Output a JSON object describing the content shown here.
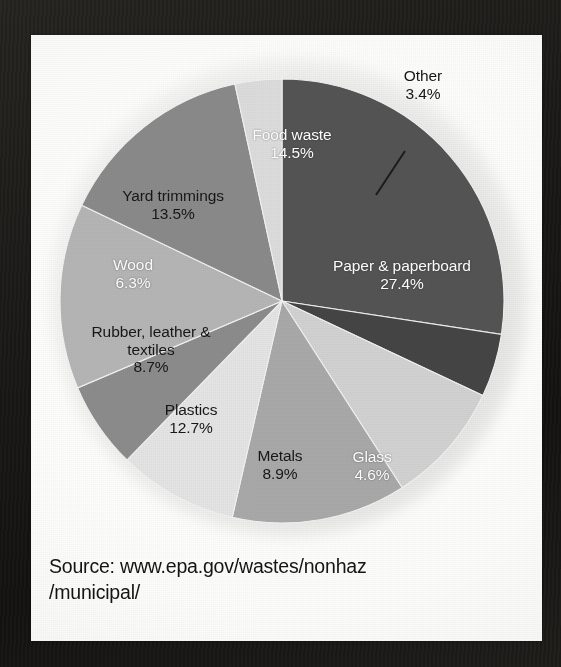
{
  "page": {
    "source_note_line1": "Source: www.epa.gov/wastes/nonhaz",
    "source_note_line2": "/municipal/"
  },
  "chart_data": {
    "type": "pie",
    "title": "",
    "subtitle": "",
    "xlabel": "",
    "ylabel": "",
    "legend_position": "none",
    "labels_inside_slices": true,
    "value_unit": "percent",
    "total": 100.0,
    "start_angle_deg": 0,
    "direction": "clockwise",
    "categories": [
      "Paper & paperboard",
      "Glass",
      "Metals",
      "Plastics",
      "Rubber, leather & textiles",
      "Wood",
      "Yard trimmings",
      "Food waste",
      "Other"
    ],
    "values": [
      27.4,
      4.6,
      8.9,
      12.7,
      8.7,
      6.3,
      13.5,
      14.5,
      3.4
    ],
    "slices": [
      {
        "name": "Paper & paperboard",
        "label_line1": "Paper & paperboard",
        "label_line2": "27.4%",
        "value": 27.4,
        "color": "#545454",
        "text_color": "#ffffff",
        "start_deg": 0,
        "end_deg": 98.64,
        "has_leader_line": false
      },
      {
        "name": "Glass",
        "label_line1": "Glass",
        "label_line2": "4.6%",
        "value": 4.6,
        "color": "#454545",
        "text_color": "#ffffff",
        "start_deg": 98.64,
        "end_deg": 115.2,
        "has_leader_line": false
      },
      {
        "name": "Metals",
        "label_line1": "Metals",
        "label_line2": "8.9%",
        "value": 8.9,
        "color": "#d2d2d2",
        "text_color": "#171717",
        "start_deg": 115.2,
        "end_deg": 147.24,
        "has_leader_line": false
      },
      {
        "name": "Plastics",
        "label_line1": "Plastics",
        "label_line2": "12.7%",
        "value": 12.7,
        "color": "#a9a9a9",
        "text_color": "#171717",
        "start_deg": 147.24,
        "end_deg": 192.96,
        "has_leader_line": false
      },
      {
        "name": "Rubber, leather & textiles",
        "label_line1": "Rubber, leather &",
        "label_line2": "textiles",
        "label_line3": "8.7%",
        "value": 8.7,
        "color": "#e4e4e4",
        "text_color": "#171717",
        "start_deg": 192.96,
        "end_deg": 224.28,
        "has_leader_line": false
      },
      {
        "name": "Wood",
        "label_line1": "Wood",
        "label_line2": "6.3%",
        "value": 6.3,
        "color": "#8c8c8c",
        "text_color": "#ffffff",
        "start_deg": 224.28,
        "end_deg": 246.96,
        "has_leader_line": false
      },
      {
        "name": "Yard trimmings",
        "label_line1": "Yard trimmings",
        "label_line2": "13.5%",
        "value": 13.5,
        "color": "#b5b5b5",
        "text_color": "#171717",
        "start_deg": 246.96,
        "end_deg": 295.56,
        "has_leader_line": false
      },
      {
        "name": "Food waste",
        "label_line1": "Food waste",
        "label_line2": "14.5%",
        "value": 14.5,
        "color": "#8a8a8a",
        "text_color": "#ffffff",
        "start_deg": 295.56,
        "end_deg": 347.76,
        "has_leader_line": false
      },
      {
        "name": "Other",
        "label_line1": "Other",
        "label_line2": "3.4%",
        "value": 3.4,
        "color": "#dcdcdc",
        "text_color": "#171717",
        "start_deg": 347.76,
        "end_deg": 360,
        "has_leader_line": true
      }
    ]
  }
}
